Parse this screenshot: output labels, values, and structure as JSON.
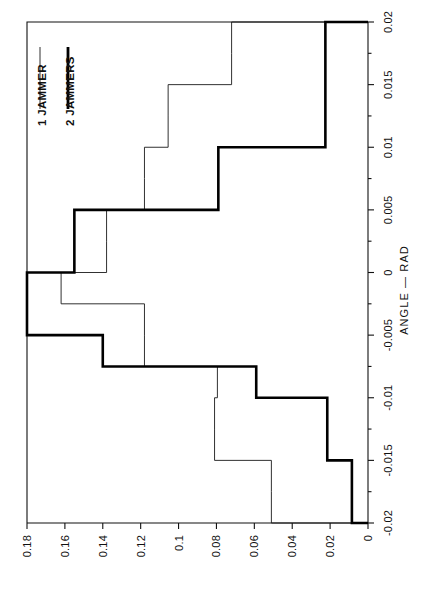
{
  "chart_data": {
    "type": "line",
    "subtype": "step-histogram",
    "title": "",
    "orientation": "rotated-90-ccw",
    "xlabel": "ANGLE  —  RAD",
    "ylabel": "",
    "xlim": [
      -0.02,
      0.02
    ],
    "ylim": [
      0,
      0.18
    ],
    "grid": false,
    "legend_position": "top-left",
    "x_ticklabels": [
      "0.02",
      "0.015",
      "0.01",
      "0.005",
      "0",
      "-0.005",
      "-0.01",
      "-0.015",
      "-0.02"
    ],
    "x_tickvalues": [
      0.02,
      0.015,
      0.01,
      0.005,
      0,
      -0.005,
      -0.01,
      -0.015,
      -0.02
    ],
    "x_minor_tick_step": 0.0025,
    "y_ticklabels": [
      "0.18",
      "0.16",
      "0.14",
      "0.12",
      "0.1",
      "0.08",
      "0.06",
      "0.04",
      "0.02",
      "0"
    ],
    "y_tickvalues": [
      0.18,
      0.16,
      0.14,
      0.12,
      0.1,
      0.08,
      0.06,
      0.04,
      0.02,
      0
    ],
    "bin_edges": [
      -0.02,
      -0.0175,
      -0.015,
      -0.0125,
      -0.01,
      -0.0075,
      -0.005,
      -0.0025,
      0,
      0.0025,
      0.005,
      0.0075,
      0.01,
      0.0125,
      0.015,
      0.0175,
      0.02
    ],
    "series": [
      {
        "name": "1 JAMMER",
        "style": "thin",
        "values": [
          0.051,
          0.051,
          0.081,
          0.081,
          0.0795,
          0.118,
          0.118,
          0.162,
          0.138,
          0.138,
          0.118,
          0.118,
          0.1055,
          0.1055,
          0.072,
          0.072
        ]
      },
      {
        "name": "2 JAMMERS",
        "style": "thick",
        "values": [
          0.0085,
          0.0085,
          0.0215,
          0.0215,
          0.059,
          0.14,
          0.18,
          0.18,
          0.155,
          0.155,
          0.079,
          0.079,
          0.0225,
          0.0225,
          0.0225,
          0.0225
        ]
      }
    ]
  },
  "axes": {
    "x_axis_label": "ANGLE  —  RAD"
  },
  "legend": {
    "entries": [
      {
        "label": "1 JAMMER",
        "style": "thin"
      },
      {
        "label": "2 JAMMERS",
        "style": "thick"
      }
    ]
  },
  "colors": {
    "series_1_jammer": "#1a1a1a",
    "series_2_jammers": "#000000",
    "axis": "#111111",
    "background": "#ffffff"
  }
}
